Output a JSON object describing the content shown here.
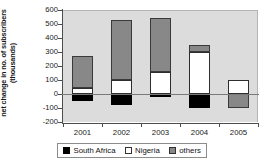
{
  "chart_data": {
    "type": "bar",
    "title": "",
    "subtitle": "",
    "xlabel": "",
    "ylabel": "net change in no. of subscribers (thousands)",
    "ylabel_line1": "net change in no. of subscribers",
    "ylabel_line2": "(thousands)",
    "categories": [
      "2001",
      "2002",
      "2003",
      "2004",
      "2005"
    ],
    "ylim": [
      -200,
      600
    ],
    "yticks": [
      600,
      500,
      400,
      300,
      200,
      100,
      0,
      -100,
      -200
    ],
    "ytick_labels": [
      "600",
      "500",
      "400",
      "300",
      "200",
      "100",
      "0",
      "-100",
      "-200"
    ],
    "stacked": true,
    "grid": false,
    "legend_position": "bottom",
    "series": [
      {
        "name": "South Africa",
        "color": "#000000",
        "values": [
          -50,
          -80,
          -20,
          -100,
          0
        ]
      },
      {
        "name": "Nigeria",
        "color": "#ffffff",
        "values": [
          40,
          100,
          160,
          300,
          100
        ]
      },
      {
        "name": "others",
        "color": "#888888",
        "values": [
          230,
          430,
          380,
          50,
          -100
        ]
      }
    ]
  },
  "legend": {
    "items": [
      {
        "label": "South Africa",
        "swatch": "black-square-swatch"
      },
      {
        "label": "Nigeria",
        "swatch": "white-square-swatch"
      },
      {
        "label": "others",
        "swatch": "gray-square-swatch"
      }
    ]
  }
}
